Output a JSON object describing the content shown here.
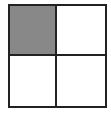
{
  "diagram": {
    "type": "2x2 grid",
    "rows": 2,
    "cols": 2,
    "cells": [
      {
        "row": 0,
        "col": 0,
        "fill": "#888888",
        "shaded": true
      },
      {
        "row": 0,
        "col": 1,
        "fill": "#ffffff",
        "shaded": false
      },
      {
        "row": 1,
        "col": 0,
        "fill": "#ffffff",
        "shaded": false
      },
      {
        "row": 1,
        "col": 1,
        "fill": "#ffffff",
        "shaded": false
      }
    ],
    "line_color": "#222222"
  }
}
